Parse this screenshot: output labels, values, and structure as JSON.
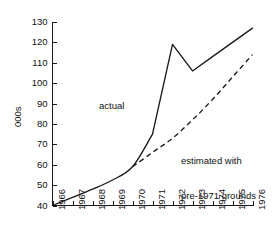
{
  "chart_data": {
    "type": "line",
    "title": "",
    "xlabel": "",
    "ylabel": "000s",
    "x": [
      1966,
      1967,
      1968,
      1969,
      1970,
      1971,
      1972,
      1973,
      1974,
      1975,
      1976
    ],
    "categories": [
      "1966",
      "1967",
      "1968",
      "1969",
      "1970",
      "1971",
      "1972",
      "1973",
      "1974",
      "1975",
      "1976"
    ],
    "xlim": [
      1966,
      1976
    ],
    "ylim": [
      40,
      130
    ],
    "ytick_values": [
      40,
      50,
      60,
      70,
      80,
      90,
      100,
      110,
      120,
      130
    ],
    "ytick_labels": [
      "40",
      "50",
      "60",
      "70",
      "80",
      "90",
      "100",
      "110",
      "120",
      "130"
    ],
    "grid": false,
    "legend": "none",
    "series": [
      {
        "name": "actual",
        "style": "solid",
        "color": "#1a1a1a",
        "x": [
          1966,
          1967,
          1968,
          1969,
          1970,
          1971,
          1972,
          1973,
          1974,
          1975,
          1976
        ],
        "values": [
          40,
          44,
          48,
          52.5,
          59,
          75,
          119,
          106,
          113,
          120,
          127
        ]
      },
      {
        "name": "estimated with pre-1971 grounds",
        "style": "dashed",
        "color": "#1a1a1a",
        "x": [
          1970,
          1971,
          1972,
          1973,
          1974,
          1975,
          1976
        ],
        "values": [
          59,
          66,
          73,
          82,
          92,
          103,
          114
        ]
      }
    ],
    "annotations": [
      {
        "id": "actual",
        "text": "actual"
      },
      {
        "id": "estimated",
        "line1": "estimated with",
        "line2": "pre-1971 grounds"
      }
    ]
  }
}
